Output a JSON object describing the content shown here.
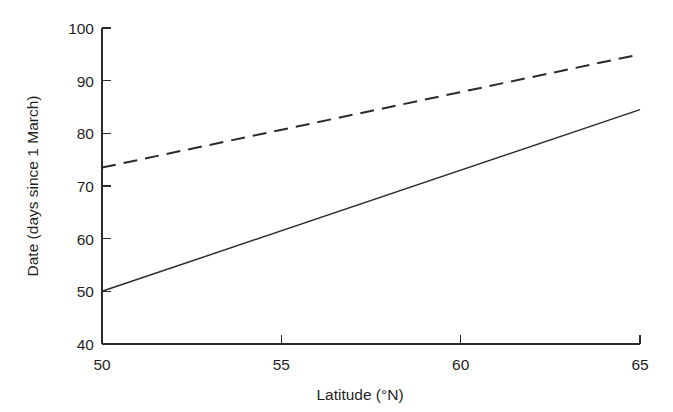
{
  "chart_data": {
    "type": "line",
    "title": "",
    "subtitle": "",
    "xlabel": "Latitude (°N)",
    "ylabel": "Date (days since 1 March)",
    "xlim": [
      50,
      65
    ],
    "ylim": [
      40,
      100
    ],
    "xticks": [
      50,
      55,
      60,
      65
    ],
    "yticks": [
      40,
      50,
      60,
      70,
      80,
      90,
      100
    ],
    "xtick_labels": [
      "50",
      "55",
      "60",
      "65"
    ],
    "ytick_labels": [
      "40",
      "50",
      "60",
      "70",
      "80",
      "90",
      "100"
    ],
    "grid": false,
    "legend": null,
    "legend_position": "none",
    "annotations": [],
    "background_color": "#ffffff",
    "line_color": "#2b2b2b",
    "series": [
      {
        "name": "solid-line",
        "style": "solid",
        "color": "#2b2b2b",
        "x": [
          50,
          65
        ],
        "values": [
          50,
          84.5
        ]
      },
      {
        "name": "dashed-line",
        "style": "dashed",
        "color": "#2b2b2b",
        "x": [
          50,
          65
        ],
        "values": [
          73.5,
          95
        ]
      }
    ]
  },
  "axes": {
    "x_title": "Latitude (°N)",
    "y_title": "Date (days since 1 March)"
  },
  "ticks": {
    "y": {
      "t100": "100",
      "t90": "90",
      "t80": "80",
      "t70": "70",
      "t60": "60",
      "t50": "50",
      "t40": "40"
    },
    "x": {
      "t50": "50",
      "t55": "55",
      "t60": "60",
      "t65": "65"
    }
  }
}
